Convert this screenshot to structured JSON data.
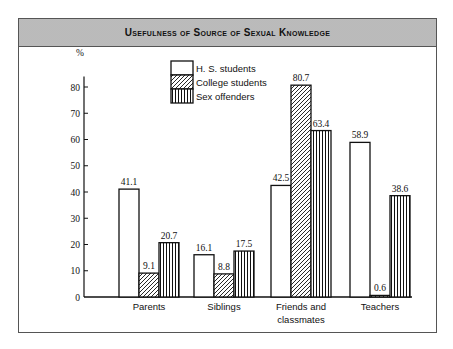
{
  "chart_data": {
    "type": "bar",
    "title": "Usefulness of Source of Sexual Knowledge",
    "xlabel": "",
    "ylabel": "%",
    "ylim": [
      0,
      85
    ],
    "yticks": [
      0,
      10,
      20,
      30,
      40,
      50,
      60,
      70,
      80
    ],
    "grid": false,
    "legend_position": "top-center",
    "categories": [
      "Parents",
      "Siblings",
      "Friends and classmates",
      "Teachers"
    ],
    "series": [
      {
        "name": "H. S. students",
        "pattern": "plain",
        "values": [
          41.1,
          16.1,
          42.5,
          58.9
        ],
        "labels": [
          "41.1",
          "16.1",
          "42.5",
          "58.9"
        ]
      },
      {
        "name": "College students",
        "pattern": "diagonal-hatch",
        "values": [
          9.1,
          8.8,
          80.7,
          0.6
        ],
        "labels": [
          "9.1",
          "8.8",
          "80.7",
          "0.6"
        ]
      },
      {
        "name": "Sex offenders",
        "pattern": "vertical-lines",
        "values": [
          20.7,
          17.5,
          63.4,
          38.6
        ],
        "labels": [
          "20.7",
          "17.5",
          "63.4",
          "38.6"
        ]
      }
    ]
  },
  "header": {
    "title": "Usefulness of Source of Sexual Knowledge"
  },
  "axis": {
    "y_unit": "%"
  },
  "legend": {
    "items": [
      "H. S. students",
      "College students",
      "Sex offenders"
    ]
  },
  "colors": {
    "ink": "#111111",
    "frame": "#555555",
    "header_bg": "#d6d6d6"
  }
}
